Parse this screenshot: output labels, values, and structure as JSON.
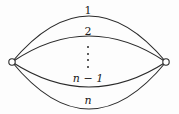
{
  "figure": {
    "background_color": "#fdfdfd",
    "stroke_color": "#2a2a2a",
    "vertex": {
      "fill_color": "#ffffff",
      "stroke_color": "#2a2a2a",
      "radius": 3.2,
      "left": {
        "x": 12,
        "y": 62,
        "name": "left-vertex"
      },
      "right": {
        "x": 166,
        "y": 62,
        "name": "right-vertex"
      }
    },
    "edges": [
      {
        "id": "edge-1",
        "label": "1",
        "label_x": 88,
        "label_y": 10,
        "curve_offset": -46,
        "italic": false
      },
      {
        "id": "edge-2",
        "label": "2",
        "label_x": 88,
        "label_y": 31,
        "curve_offset": -26,
        "italic": false
      },
      {
        "id": "edge-n-1",
        "label": "n − 1",
        "label_x": 88,
        "label_y": 78,
        "curve_offset": 25,
        "italic": true
      },
      {
        "id": "edge-n",
        "label": "n",
        "label_x": 88,
        "label_y": 100,
        "curve_offset": 47,
        "italic": true
      }
    ],
    "ellipsis": {
      "name": "vertical-ellipsis",
      "x": 88,
      "y": 57,
      "dot_count": 4
    },
    "label_font_size": "11px"
  }
}
